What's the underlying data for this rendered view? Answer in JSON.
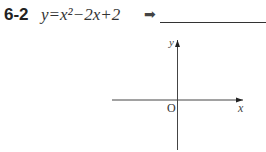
{
  "problem": {
    "number": "6-2",
    "equation": "y=x²−2x+2",
    "arrow": "➡",
    "answer": ""
  },
  "graph": {
    "x_label": "x",
    "y_label": "y",
    "origin_label": "O"
  }
}
